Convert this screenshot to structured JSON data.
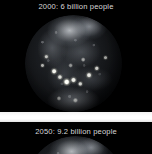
{
  "image": {
    "background_color": "#000000",
    "caption_color": "#d8d8d8",
    "divider_color": "#ffffff"
  },
  "panels": [
    {
      "id": "panel-2000",
      "caption": "2000:  6 billion people",
      "year": "2000",
      "population": "6 billion people",
      "globe_name": "earth-night-lights-globe"
    },
    {
      "id": "panel-2050",
      "caption": "2050:  9.2 billion people",
      "year": "2050",
      "population": "9.2 billion people",
      "globe_name": "earth-night-lights-globe"
    }
  ]
}
